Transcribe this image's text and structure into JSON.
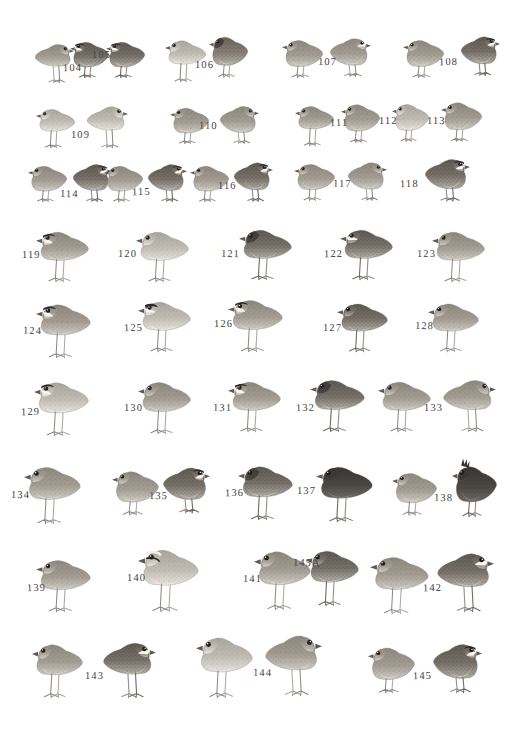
{
  "plate": {
    "title": "Quail and Buttonquail identification plate",
    "medium": "grayscale watercolour field-guide plate",
    "background_color": "#ffffff",
    "ink_color": "#474442",
    "width": 522,
    "height": 737,
    "figure_count": 44,
    "label_count": 42,
    "number_range": "104-145A"
  },
  "rows": [
    {
      "row_index": 1,
      "labels": [
        "104",
        "105",
        "106",
        "107",
        "108"
      ],
      "figure_count": 9
    },
    {
      "row_index": 2,
      "labels": [
        "109",
        "110",
        "111",
        "112",
        "113"
      ],
      "figure_count": 8
    },
    {
      "row_index": 3,
      "labels": [
        "114",
        "115",
        "116",
        "117",
        "118"
      ],
      "figure_count": 9
    },
    {
      "row_index": 4,
      "labels": [
        "119",
        "120",
        "121",
        "122",
        "123"
      ],
      "figure_count": 5
    },
    {
      "row_index": 5,
      "labels": [
        "124",
        "125",
        "126",
        "127",
        "128"
      ],
      "figure_count": 5
    },
    {
      "row_index": 6,
      "labels": [
        "129",
        "130",
        "131",
        "132",
        "133"
      ],
      "figure_count": 6
    },
    {
      "row_index": 7,
      "labels": [
        "134",
        "135",
        "136",
        "137",
        "138"
      ],
      "figure_count": 7
    },
    {
      "row_index": 8,
      "labels": [
        "139",
        "140",
        "141",
        "145A",
        "142"
      ],
      "figure_count": 6
    },
    {
      "row_index": 9,
      "labels": [
        "143",
        "144",
        "145"
      ],
      "figure_count": 6
    }
  ],
  "labels": [
    {
      "id": "104",
      "text": "104",
      "x": 63,
      "y": 62
    },
    {
      "id": "105",
      "text": "105",
      "x": 92,
      "y": 49
    },
    {
      "id": "106",
      "text": "106",
      "x": 195,
      "y": 59
    },
    {
      "id": "107",
      "text": "107",
      "x": 318,
      "y": 56
    },
    {
      "id": "108",
      "text": "108",
      "x": 439,
      "y": 56
    },
    {
      "id": "109",
      "text": "109",
      "x": 71,
      "y": 129
    },
    {
      "id": "110",
      "text": "110",
      "x": 199,
      "y": 120
    },
    {
      "id": "111",
      "text": "111",
      "x": 330,
      "y": 117
    },
    {
      "id": "112",
      "text": "112",
      "x": 379,
      "y": 115
    },
    {
      "id": "113",
      "text": "113",
      "x": 427,
      "y": 115
    },
    {
      "id": "114",
      "text": "114",
      "x": 60,
      "y": 188
    },
    {
      "id": "115",
      "text": "115",
      "x": 132,
      "y": 186
    },
    {
      "id": "116",
      "text": "116",
      "x": 218,
      "y": 180
    },
    {
      "id": "117",
      "text": "117",
      "x": 333,
      "y": 178
    },
    {
      "id": "118",
      "text": "118",
      "x": 400,
      "y": 178
    },
    {
      "id": "119",
      "text": "119",
      "x": 22,
      "y": 249
    },
    {
      "id": "120",
      "text": "120",
      "x": 118,
      "y": 248
    },
    {
      "id": "121",
      "text": "121",
      "x": 221,
      "y": 248
    },
    {
      "id": "122",
      "text": "122",
      "x": 324,
      "y": 248
    },
    {
      "id": "123",
      "text": "123",
      "x": 417,
      "y": 248
    },
    {
      "id": "124",
      "text": "124",
      "x": 23,
      "y": 325
    },
    {
      "id": "125",
      "text": "125",
      "x": 124,
      "y": 322
    },
    {
      "id": "126",
      "text": "126",
      "x": 214,
      "y": 318
    },
    {
      "id": "127",
      "text": "127",
      "x": 323,
      "y": 322
    },
    {
      "id": "128",
      "text": "128",
      "x": 415,
      "y": 320
    },
    {
      "id": "129",
      "text": "129",
      "x": 21,
      "y": 406
    },
    {
      "id": "130",
      "text": "130",
      "x": 124,
      "y": 402
    },
    {
      "id": "131",
      "text": "131",
      "x": 213,
      "y": 402
    },
    {
      "id": "132",
      "text": "132",
      "x": 296,
      "y": 402
    },
    {
      "id": "133",
      "text": "133",
      "x": 424,
      "y": 402
    },
    {
      "id": "134",
      "text": "134",
      "x": 11,
      "y": 489
    },
    {
      "id": "135",
      "text": "135",
      "x": 149,
      "y": 490
    },
    {
      "id": "136",
      "text": "136",
      "x": 225,
      "y": 487
    },
    {
      "id": "137",
      "text": "137",
      "x": 297,
      "y": 485
    },
    {
      "id": "138",
      "text": "138",
      "x": 434,
      "y": 492
    },
    {
      "id": "139",
      "text": "139",
      "x": 27,
      "y": 582
    },
    {
      "id": "140",
      "text": "140",
      "x": 127,
      "y": 572
    },
    {
      "id": "141",
      "text": "141",
      "x": 243,
      "y": 573
    },
    {
      "id": "145A",
      "text": "145A",
      "x": 293,
      "y": 557
    },
    {
      "id": "142",
      "text": "142",
      "x": 423,
      "y": 582
    },
    {
      "id": "143",
      "text": "143",
      "x": 85,
      "y": 670
    },
    {
      "id": "144",
      "text": "144",
      "x": 253,
      "y": 667
    },
    {
      "id": "145",
      "text": "145",
      "x": 413,
      "y": 670
    }
  ],
  "figures": [
    {
      "id": "f104",
      "label": "104",
      "x": 34,
      "y": 38,
      "w": 40,
      "h": 45,
      "tone": "mid",
      "pose": "left",
      "face": "plain",
      "legs": "long"
    },
    {
      "id": "f105a",
      "label": "105",
      "x": 70,
      "y": 36,
      "w": 40,
      "h": 44,
      "tone": "dark",
      "pose": "right",
      "face": "masked",
      "legs": "short"
    },
    {
      "id": "f105b",
      "label": "105",
      "x": 106,
      "y": 36,
      "w": 40,
      "h": 44,
      "tone": "dark",
      "pose": "right",
      "face": "masked",
      "legs": "short"
    },
    {
      "id": "f106a",
      "label": "106",
      "x": 165,
      "y": 34,
      "w": 42,
      "h": 48,
      "tone": "pale",
      "pose": "right",
      "face": "plain",
      "legs": "long"
    },
    {
      "id": "f106b",
      "label": "106",
      "x": 209,
      "y": 30,
      "w": 40,
      "h": 50,
      "tone": "rufous",
      "pose": "right",
      "face": "dark",
      "legs": "short"
    },
    {
      "id": "f107a",
      "label": "107",
      "x": 282,
      "y": 34,
      "w": 42,
      "h": 46,
      "tone": "mid",
      "pose": "right",
      "face": "plain",
      "legs": "short"
    },
    {
      "id": "f107b",
      "label": "107",
      "x": 329,
      "y": 32,
      "w": 42,
      "h": 47,
      "tone": "mid",
      "pose": "left",
      "face": "scaled",
      "legs": "short"
    },
    {
      "id": "f108a",
      "label": "108",
      "x": 403,
      "y": 34,
      "w": 42,
      "h": 46,
      "tone": "mid",
      "pose": "right",
      "face": "plain",
      "legs": "short"
    },
    {
      "id": "f108b",
      "label": "108",
      "x": 460,
      "y": 30,
      "w": 40,
      "h": 48,
      "tone": "dark",
      "pose": "left",
      "face": "masked",
      "legs": "short"
    },
    {
      "id": "f109a",
      "label": "109",
      "x": 36,
      "y": 103,
      "w": 40,
      "h": 45,
      "tone": "pale",
      "pose": "right",
      "face": "plain",
      "legs": "long"
    },
    {
      "id": "f109b",
      "label": "109",
      "x": 86,
      "y": 100,
      "w": 42,
      "h": 48,
      "tone": "pale",
      "pose": "left",
      "face": "plain",
      "legs": "long"
    },
    {
      "id": "f110a",
      "label": "110",
      "x": 170,
      "y": 102,
      "w": 40,
      "h": 44,
      "tone": "mid",
      "pose": "right",
      "face": "plain",
      "legs": "short"
    },
    {
      "id": "f110b",
      "label": "110",
      "x": 219,
      "y": 100,
      "w": 40,
      "h": 46,
      "tone": "mid",
      "pose": "left",
      "face": "plain",
      "legs": "short"
    },
    {
      "id": "f111a",
      "label": "111",
      "x": 295,
      "y": 100,
      "w": 40,
      "h": 46,
      "tone": "mid",
      "pose": "right",
      "face": "plain",
      "legs": "long"
    },
    {
      "id": "f111b",
      "label": "111",
      "x": 341,
      "y": 98,
      "w": 40,
      "h": 47,
      "tone": "mid",
      "pose": "right",
      "face": "plain",
      "legs": "short"
    },
    {
      "id": "f112",
      "label": "112",
      "x": 392,
      "y": 98,
      "w": 38,
      "h": 46,
      "tone": "pale",
      "pose": "right",
      "face": "plain",
      "legs": "short"
    },
    {
      "id": "f113",
      "label": "113",
      "x": 441,
      "y": 96,
      "w": 42,
      "h": 48,
      "tone": "mid",
      "pose": "right",
      "face": "plain",
      "legs": "short"
    },
    {
      "id": "f114a",
      "label": "114",
      "x": 28,
      "y": 160,
      "w": 40,
      "h": 44,
      "tone": "mid",
      "pose": "right",
      "face": "plain",
      "legs": "short"
    },
    {
      "id": "f114b",
      "label": "114",
      "x": 72,
      "y": 158,
      "w": 40,
      "h": 46,
      "tone": "dark",
      "pose": "left",
      "face": "masked",
      "legs": "short"
    },
    {
      "id": "f115a",
      "label": "115",
      "x": 104,
      "y": 160,
      "w": 40,
      "h": 44,
      "tone": "mid",
      "pose": "right",
      "face": "plain",
      "legs": "short"
    },
    {
      "id": "f115b",
      "label": "115",
      "x": 147,
      "y": 158,
      "w": 40,
      "h": 46,
      "tone": "dark",
      "pose": "left",
      "face": "masked",
      "legs": "short"
    },
    {
      "id": "f116a",
      "label": "116",
      "x": 190,
      "y": 160,
      "w": 40,
      "h": 44,
      "tone": "mid",
      "pose": "right",
      "face": "plain",
      "legs": "short"
    },
    {
      "id": "f116b",
      "label": "116",
      "x": 233,
      "y": 156,
      "w": 40,
      "h": 48,
      "tone": "dark",
      "pose": "left",
      "face": "masked",
      "legs": "short"
    },
    {
      "id": "f117a",
      "label": "117",
      "x": 294,
      "y": 158,
      "w": 42,
      "h": 45,
      "tone": "mid",
      "pose": "right",
      "face": "plain",
      "legs": "short"
    },
    {
      "id": "f117b",
      "label": "117",
      "x": 347,
      "y": 156,
      "w": 40,
      "h": 47,
      "tone": "mid",
      "pose": "left",
      "face": "plain",
      "legs": "short"
    },
    {
      "id": "f118",
      "label": "118",
      "x": 424,
      "y": 152,
      "w": 46,
      "h": 52,
      "tone": "dark",
      "pose": "left",
      "face": "masked",
      "legs": "short"
    },
    {
      "id": "f119",
      "label": "119",
      "x": 36,
      "y": 224,
      "w": 54,
      "h": 58,
      "tone": "mid",
      "pose": "right",
      "face": "masked",
      "legs": "long"
    },
    {
      "id": "f120",
      "label": "120",
      "x": 136,
      "y": 224,
      "w": 54,
      "h": 58,
      "tone": "pale",
      "pose": "right",
      "face": "plain",
      "legs": "long"
    },
    {
      "id": "f121",
      "label": "121",
      "x": 239,
      "y": 222,
      "w": 54,
      "h": 58,
      "tone": "dark",
      "pose": "right",
      "face": "dark",
      "legs": "long"
    },
    {
      "id": "f122",
      "label": "122",
      "x": 340,
      "y": 222,
      "w": 54,
      "h": 58,
      "tone": "dark",
      "pose": "right",
      "face": "scaled",
      "legs": "long"
    },
    {
      "id": "f123",
      "label": "123",
      "x": 432,
      "y": 224,
      "w": 54,
      "h": 58,
      "tone": "mid",
      "pose": "right",
      "face": "plain",
      "legs": "long"
    },
    {
      "id": "f124",
      "label": "124",
      "x": 36,
      "y": 296,
      "w": 56,
      "h": 62,
      "tone": "mid",
      "pose": "right",
      "face": "masked",
      "legs": "long"
    },
    {
      "id": "f125",
      "label": "125",
      "x": 138,
      "y": 294,
      "w": 54,
      "h": 58,
      "tone": "pale",
      "pose": "right",
      "face": "rufous",
      "legs": "long"
    },
    {
      "id": "f126",
      "label": "126",
      "x": 228,
      "y": 292,
      "w": 56,
      "h": 60,
      "tone": "mid",
      "pose": "right",
      "face": "masked",
      "legs": "long"
    },
    {
      "id": "f127",
      "label": "127",
      "x": 337,
      "y": 296,
      "w": 52,
      "h": 56,
      "tone": "dark",
      "pose": "right",
      "face": "plain",
      "legs": "long"
    },
    {
      "id": "f128",
      "label": "128",
      "x": 428,
      "y": 296,
      "w": 52,
      "h": 56,
      "tone": "mid",
      "pose": "right",
      "face": "plain",
      "legs": "long"
    },
    {
      "id": "f129",
      "label": "129",
      "x": 34,
      "y": 374,
      "w": 56,
      "h": 62,
      "tone": "pale",
      "pose": "right",
      "face": "masked",
      "legs": "long"
    },
    {
      "id": "f130",
      "label": "130",
      "x": 138,
      "y": 374,
      "w": 54,
      "h": 60,
      "tone": "mid",
      "pose": "right",
      "face": "plain",
      "legs": "long"
    },
    {
      "id": "f131",
      "label": "131",
      "x": 228,
      "y": 374,
      "w": 54,
      "h": 58,
      "tone": "mid",
      "pose": "right",
      "face": "masked",
      "legs": "long"
    },
    {
      "id": "f132",
      "label": "132",
      "x": 310,
      "y": 372,
      "w": 56,
      "h": 60,
      "tone": "dark",
      "pose": "right",
      "face": "dark",
      "legs": "long"
    },
    {
      "id": "f133a",
      "label": "133",
      "x": 378,
      "y": 374,
      "w": 54,
      "h": 58,
      "tone": "mid",
      "pose": "right",
      "face": "plain",
      "legs": "long"
    },
    {
      "id": "f133b",
      "label": "133",
      "x": 442,
      "y": 372,
      "w": 54,
      "h": 60,
      "tone": "mid",
      "pose": "left",
      "face": "plain",
      "legs": "long"
    },
    {
      "id": "f134",
      "label": "134",
      "x": 24,
      "y": 458,
      "w": 58,
      "h": 66,
      "tone": "mid",
      "pose": "right",
      "face": "plain",
      "legs": "long"
    },
    {
      "id": "f135a",
      "label": "135",
      "x": 112,
      "y": 464,
      "w": 48,
      "h": 54,
      "tone": "mid",
      "pose": "right",
      "face": "plain",
      "legs": "short"
    },
    {
      "id": "f135b",
      "label": "135",
      "x": 162,
      "y": 460,
      "w": 48,
      "h": 56,
      "tone": "dark",
      "pose": "left",
      "face": "masked",
      "legs": "short"
    },
    {
      "id": "f136",
      "label": "136",
      "x": 238,
      "y": 458,
      "w": 56,
      "h": 62,
      "tone": "dark",
      "pose": "right",
      "face": "dark",
      "legs": "long"
    },
    {
      "id": "f137",
      "label": "137",
      "x": 316,
      "y": 458,
      "w": 58,
      "h": 64,
      "tone": "black",
      "pose": "right",
      "face": "dark",
      "legs": "long"
    },
    {
      "id": "f138a",
      "label": "138",
      "x": 392,
      "y": 466,
      "w": 46,
      "h": 52,
      "tone": "mid",
      "pose": "right",
      "face": "plain",
      "legs": "short"
    },
    {
      "id": "f138b",
      "label": "138",
      "x": 452,
      "y": 458,
      "w": 46,
      "h": 62,
      "tone": "black",
      "pose": "right",
      "face": "crest",
      "legs": "short"
    },
    {
      "id": "f139",
      "label": "139",
      "x": 36,
      "y": 552,
      "w": 56,
      "h": 60,
      "tone": "mid",
      "pose": "right",
      "face": "plain",
      "legs": "long"
    },
    {
      "id": "f140",
      "label": "140",
      "x": 138,
      "y": 540,
      "w": 62,
      "h": 72,
      "tone": "pale",
      "pose": "right",
      "face": "striped",
      "legs": "long"
    },
    {
      "id": "f141",
      "label": "141",
      "x": 254,
      "y": 542,
      "w": 58,
      "h": 68,
      "tone": "mid",
      "pose": "right",
      "face": "plain",
      "legs": "long"
    },
    {
      "id": "f145A",
      "label": "145A",
      "x": 306,
      "y": 542,
      "w": 54,
      "h": 64,
      "tone": "dark",
      "pose": "right",
      "face": "plain",
      "legs": "long"
    },
    {
      "id": "f142a",
      "label": "142",
      "x": 370,
      "y": 548,
      "w": 60,
      "h": 66,
      "tone": "mid",
      "pose": "right",
      "face": "plain",
      "legs": "long"
    },
    {
      "id": "f142b",
      "label": "142",
      "x": 436,
      "y": 544,
      "w": 58,
      "h": 68,
      "tone": "dark",
      "pose": "left",
      "face": "scaled",
      "legs": "long"
    },
    {
      "id": "f143a",
      "label": "143",
      "x": 32,
      "y": 636,
      "w": 52,
      "h": 62,
      "tone": "mid",
      "pose": "right",
      "face": "plain",
      "legs": "long"
    },
    {
      "id": "f143b",
      "label": "143",
      "x": 102,
      "y": 634,
      "w": 54,
      "h": 64,
      "tone": "dark",
      "pose": "left",
      "face": "scaled",
      "legs": "long"
    },
    {
      "id": "f144a",
      "label": "144",
      "x": 196,
      "y": 628,
      "w": 58,
      "h": 70,
      "tone": "pale",
      "pose": "right",
      "face": "plain",
      "legs": "long"
    },
    {
      "id": "f144b",
      "label": "144",
      "x": 264,
      "y": 626,
      "w": 58,
      "h": 70,
      "tone": "mid",
      "pose": "left",
      "face": "plain",
      "legs": "long"
    },
    {
      "id": "f145a",
      "label": "145",
      "x": 368,
      "y": 640,
      "w": 48,
      "h": 56,
      "tone": "mid",
      "pose": "right",
      "face": "plain",
      "legs": "short"
    },
    {
      "id": "f145b",
      "label": "145",
      "x": 432,
      "y": 636,
      "w": 50,
      "h": 60,
      "tone": "dark",
      "pose": "left",
      "face": "masked",
      "legs": "short"
    }
  ]
}
